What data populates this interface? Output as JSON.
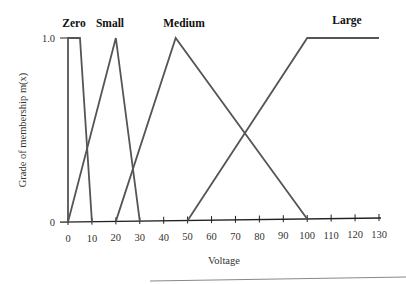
{
  "chart_data": {
    "type": "line",
    "title": "",
    "xlabel": "Voltage",
    "ylabel": "Grade of membership m(x)",
    "xlim": [
      0,
      130
    ],
    "ylim": [
      0,
      1.0
    ],
    "x_ticks": [
      0,
      10,
      20,
      30,
      40,
      50,
      60,
      70,
      80,
      90,
      100,
      110,
      120,
      130
    ],
    "y_ticks": [
      0,
      1.0
    ],
    "y_tick_labels": [
      "0",
      "1.0"
    ],
    "grid": false,
    "legend": "inline labels above each membership function",
    "series": [
      {
        "name": "Zero",
        "x": [
          0,
          0,
          5,
          10
        ],
        "y": [
          0,
          1.0,
          1.0,
          0
        ]
      },
      {
        "name": "Small",
        "x": [
          0,
          20,
          30
        ],
        "y": [
          0,
          1.0,
          0
        ]
      },
      {
        "name": "Medium",
        "x": [
          20,
          45,
          100
        ],
        "y": [
          0,
          1.0,
          0
        ]
      },
      {
        "name": "Large",
        "x": [
          50,
          100,
          130
        ],
        "y": [
          0,
          1.0,
          1.0
        ]
      }
    ]
  }
}
